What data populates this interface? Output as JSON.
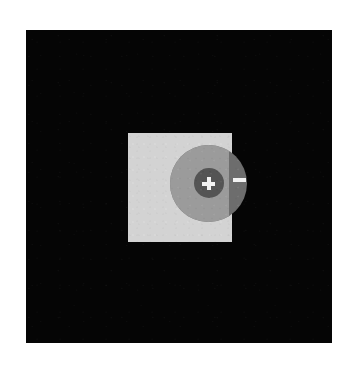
{
  "viewport": {
    "name": "dark-canvas",
    "background_color": "#050505",
    "border_color": "#ffffff",
    "width": 306,
    "height": 313
  },
  "panel": {
    "label": "",
    "color": "#d3d3d3",
    "width": 104,
    "height": 109
  },
  "zoom_control": {
    "label": "",
    "wheel_color_inside": "#9b9b9b",
    "wheel_color_outside": "#6d6d6d",
    "hub_color": "#545454",
    "glyph_color": "#f2f2f2",
    "zoom_in": {
      "icon": "plus-icon",
      "label": "Zoom in",
      "symbol": "+"
    },
    "zoom_out": {
      "icon": "minus-icon",
      "label": "Zoom out",
      "symbol": "−"
    }
  }
}
